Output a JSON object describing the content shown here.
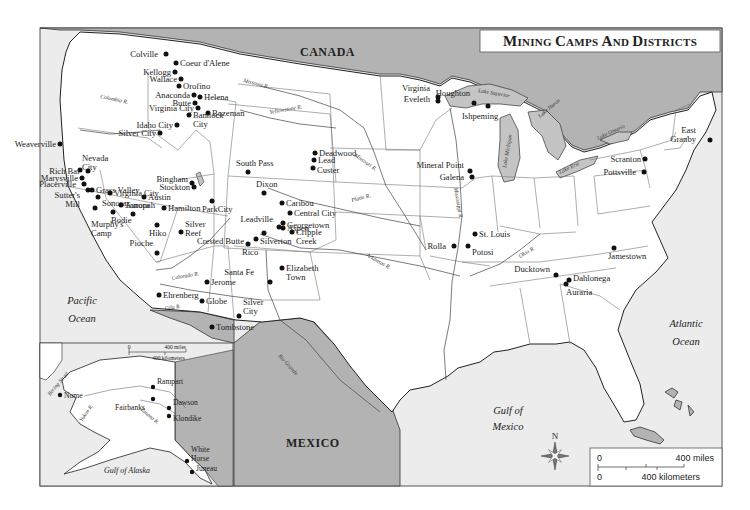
{
  "title": "Mining Camps and Districts",
  "countries": {
    "canada": "CANADA",
    "mexico": "MEXICO"
  },
  "water_bodies": {
    "pacific": [
      "Pacific",
      "Ocean"
    ],
    "atlantic": [
      "Atlantic",
      "Ocean"
    ],
    "gulf_mexico": [
      "Gulf of",
      "Mexico"
    ],
    "gulf_alaska": "Gulf of Alaska",
    "bering": "Bering Strait",
    "lake_superior": "Lake Superior",
    "lake_michigan": "Lake Michigan",
    "lake_huron": "Lake Huron",
    "lake_erie": "Lake Erie",
    "lake_ontario": "Lake Ontario"
  },
  "rivers": {
    "columbia": "Columbia R.",
    "missouri_upper": "Missouri R.",
    "yellowstone": "Yellowstone R.",
    "missouri_lower": "Missouri R.",
    "platte": "Platte R.",
    "arkansas": "Arkansas R.",
    "colorado": "Colorado R.",
    "gila": "Gila R.",
    "rio_grande": "Rio Grande",
    "mississippi": "Mississippi R.",
    "ohio": "Ohio R.",
    "yukon": "Yukon R.",
    "tanana": "Tanana R."
  },
  "camps": [
    {
      "name": "Colville",
      "lines": [
        "Colville"
      ]
    },
    {
      "name": "Coeur d'Alene",
      "lines": [
        "Coeur d'Alene"
      ]
    },
    {
      "name": "Kellogg",
      "lines": [
        "Kellogg"
      ]
    },
    {
      "name": "Wallace",
      "lines": [
        "Wallace"
      ]
    },
    {
      "name": "Orofino",
      "lines": [
        "Orofino"
      ]
    },
    {
      "name": "Anaconda",
      "lines": [
        "Anaconda"
      ]
    },
    {
      "name": "Helena",
      "lines": [
        "Helena"
      ]
    },
    {
      "name": "Butte",
      "lines": [
        "Butte"
      ]
    },
    {
      "name": "Bozeman",
      "lines": [
        "Bozeman"
      ]
    },
    {
      "name": "Virginia City (MT)",
      "lines": [
        "Virginia City"
      ]
    },
    {
      "name": "Bannock City",
      "lines": [
        "Bannock",
        "City"
      ]
    },
    {
      "name": "Idaho City",
      "lines": [
        "Idaho City"
      ]
    },
    {
      "name": "Silver City (ID)",
      "lines": [
        "Silver City"
      ]
    },
    {
      "name": "Weaverville",
      "lines": [
        "Weaverville"
      ]
    },
    {
      "name": "Nevada City",
      "lines": [
        "Nevada",
        "City"
      ]
    },
    {
      "name": "Rich Bar",
      "lines": [
        "Rich Bar"
      ]
    },
    {
      "name": "Marysville",
      "lines": [
        "Marysville"
      ]
    },
    {
      "name": "Placerville",
      "lines": [
        "Placerville"
      ]
    },
    {
      "name": "Sutter's Mill",
      "lines": [
        "Sutter's",
        "Mill"
      ]
    },
    {
      "name": "Grass Valley",
      "lines": [
        "Grass Valley"
      ]
    },
    {
      "name": "Sonora",
      "lines": [
        "Sonora"
      ]
    },
    {
      "name": "Murphy's Camp",
      "lines": [
        "Murphy's",
        "Camp"
      ]
    },
    {
      "name": "Virginia City (NV)",
      "lines": [
        "Virginia City"
      ]
    },
    {
      "name": "Austin",
      "lines": [
        "Austin"
      ]
    },
    {
      "name": "Aurora",
      "lines": [
        "Aurora"
      ]
    },
    {
      "name": "Bodie",
      "lines": [
        "Bodie"
      ]
    },
    {
      "name": "Tonopah",
      "lines": [
        "Tonopah"
      ]
    },
    {
      "name": "Hamilton",
      "lines": [
        "Hamilton"
      ]
    },
    {
      "name": "Hiko",
      "lines": [
        "Hiko"
      ]
    },
    {
      "name": "Silver Reef",
      "lines": [
        "Silver",
        "Reef"
      ]
    },
    {
      "name": "Pioche",
      "lines": [
        "Pioche"
      ]
    },
    {
      "name": "Bingham",
      "lines": [
        "Bingham"
      ]
    },
    {
      "name": "Stockton",
      "lines": [
        "Stockton"
      ]
    },
    {
      "name": "Park City",
      "lines": [
        "ParkCity"
      ]
    },
    {
      "name": "South Pass",
      "lines": [
        "South Pass"
      ]
    },
    {
      "name": "Dixon",
      "lines": [
        "Dixon"
      ]
    },
    {
      "name": "Deadwood",
      "lines": [
        "Deadwood"
      ]
    },
    {
      "name": "Lead",
      "lines": [
        "Lead"
      ]
    },
    {
      "name": "Custer",
      "lines": [
        "Custer"
      ]
    },
    {
      "name": "Caribou",
      "lines": [
        "Caribou"
      ]
    },
    {
      "name": "Central City",
      "lines": [
        "Central City"
      ]
    },
    {
      "name": "Georgetown",
      "lines": [
        "Georgetown"
      ]
    },
    {
      "name": "Leadville",
      "lines": [
        "Leadville"
      ]
    },
    {
      "name": "Aspen",
      "lines": [
        "Aspen"
      ]
    },
    {
      "name": "Crested Butte",
      "lines": [
        "Crested Butte"
      ]
    },
    {
      "name": "Cripple Creek",
      "lines": [
        "Cripple",
        "Creek"
      ]
    },
    {
      "name": "Silverton",
      "lines": [
        "Silverton"
      ]
    },
    {
      "name": "Rico",
      "lines": [
        "Rico"
      ]
    },
    {
      "name": "Santa Fe",
      "lines": [
        "Santa Fe"
      ]
    },
    {
      "name": "Elizabeth Town",
      "lines": [
        "Elizabeth",
        "Town"
      ]
    },
    {
      "name": "Jerome",
      "lines": [
        "Jerome"
      ]
    },
    {
      "name": "Ehrenberg",
      "lines": [
        "Ehrenberg"
      ]
    },
    {
      "name": "Globe",
      "lines": [
        "Globe"
      ]
    },
    {
      "name": "Silver City (NM)",
      "lines": [
        "Silver",
        "City"
      ]
    },
    {
      "name": "Tombstone",
      "lines": [
        "Tombstone"
      ]
    },
    {
      "name": "Virginia (MN)",
      "lines": [
        "Virginia"
      ]
    },
    {
      "name": "Eveleth",
      "lines": [
        "Eveleth"
      ]
    },
    {
      "name": "Houghton",
      "lines": [
        "Houghton"
      ]
    },
    {
      "name": "Ishpeming",
      "lines": [
        "Ishpeming"
      ]
    },
    {
      "name": "Mineral Point",
      "lines": [
        "Mineral Point"
      ]
    },
    {
      "name": "Galena",
      "lines": [
        "Galena"
      ]
    },
    {
      "name": "St. Louis",
      "lines": [
        "St. Louis"
      ]
    },
    {
      "name": "Rolla",
      "lines": [
        "Rolla"
      ]
    },
    {
      "name": "Potosi",
      "lines": [
        "Potosi"
      ]
    },
    {
      "name": "East Granby",
      "lines": [
        "East",
        "Granby"
      ]
    },
    {
      "name": "Scranton",
      "lines": [
        "Scranton"
      ]
    },
    {
      "name": "Pottsville",
      "lines": [
        "Pottsville"
      ]
    },
    {
      "name": "Jamestown",
      "lines": [
        "Jamestown"
      ]
    },
    {
      "name": "Ducktown",
      "lines": [
        "Ducktown"
      ]
    },
    {
      "name": "Dahlonega",
      "lines": [
        "Dahlonega"
      ]
    },
    {
      "name": "Auraria",
      "lines": [
        "Auraria"
      ]
    },
    {
      "name": "Nome",
      "lines": [
        "Nome"
      ]
    },
    {
      "name": "Rampart",
      "lines": [
        "Rampart"
      ]
    },
    {
      "name": "Fairbanks",
      "lines": [
        "Fairbanks"
      ]
    },
    {
      "name": "Dawson",
      "lines": [
        "Dawson"
      ]
    },
    {
      "name": "Klondike",
      "lines": [
        "Klondike"
      ]
    },
    {
      "name": "White Horse",
      "lines": [
        "White",
        "Horse"
      ]
    },
    {
      "name": "Juneau",
      "lines": [
        "Juneau"
      ]
    }
  ],
  "compass": {
    "north_label": "N"
  },
  "scale": {
    "zero": "0",
    "miles": "400 miles",
    "kilometers": "400 kilometers"
  },
  "inset_scale": {
    "zero": "0",
    "miles": "400 miles",
    "kilometers": "400 kilometers"
  },
  "colors": {
    "land": "#ffffff",
    "foreign_land": "#b3b3b3",
    "water": "#ececec",
    "lakes": "#c4c4c4",
    "border": "#333333",
    "dot": "#111111"
  }
}
